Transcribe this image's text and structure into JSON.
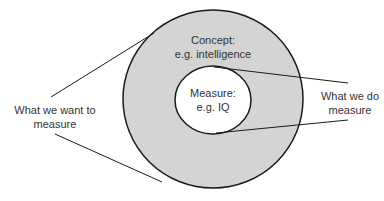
{
  "diagram": {
    "type": "concept-measure-venn",
    "colors": {
      "outer_fill": "#d4d4d4",
      "inner_fill": "#ffffff",
      "stroke": "#1a1a1a",
      "text": "#333333"
    },
    "outer_circle": {
      "title": "Concept:",
      "subtitle": "e.g. intelligence"
    },
    "inner_circle": {
      "title": "Measure:",
      "subtitle": "e.g. IQ"
    },
    "left_callout": {
      "line1": "What we want to",
      "line2": "measure"
    },
    "right_callout": {
      "line1": "What we do",
      "line2": "measure"
    }
  }
}
